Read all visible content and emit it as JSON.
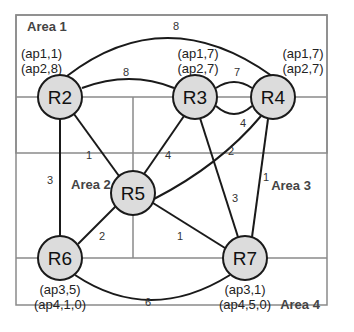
{
  "colors": {
    "frame": "#8a8a8a",
    "link": "#1a1a1a",
    "node_fill": "#dcdcdc",
    "node_stroke": "#1a1a1a",
    "background": "#ffffff"
  },
  "areas": [
    {
      "id": "area1",
      "label": "Area 1"
    },
    {
      "id": "area2",
      "label": "Area 2"
    },
    {
      "id": "area3",
      "label": "Area 3"
    },
    {
      "id": "area4",
      "label": "Area 4"
    }
  ],
  "nodes": [
    {
      "id": "R2",
      "label": "R2",
      "ap": [
        "(ap1,1)",
        "(ap2,8)"
      ]
    },
    {
      "id": "R3",
      "label": "R3",
      "ap": [
        "(ap1,7)",
        "(ap2,7)"
      ]
    },
    {
      "id": "R4",
      "label": "R4",
      "ap": [
        "(ap1,7)",
        "(ap2,7)"
      ]
    },
    {
      "id": "R5",
      "label": "R5",
      "ap": []
    },
    {
      "id": "R6",
      "label": "R6",
      "ap": [
        "(ap3,5)",
        "(ap4,1,0)"
      ]
    },
    {
      "id": "R7",
      "label": "R7",
      "ap": [
        "(ap3,1)",
        "(ap4,5,0)"
      ]
    }
  ],
  "links": [
    {
      "from": "R2",
      "to": "R4",
      "cost": "8",
      "shape": "arc-top"
    },
    {
      "from": "R2",
      "to": "R3",
      "cost": "8"
    },
    {
      "from": "R3",
      "to": "R4",
      "cost": "7",
      "shape": "upper"
    },
    {
      "from": "R3",
      "to": "R4",
      "cost": "4",
      "shape": "lower"
    },
    {
      "from": "R2",
      "to": "R5",
      "cost": "1"
    },
    {
      "from": "R2",
      "to": "R6",
      "cost": "3"
    },
    {
      "from": "R3",
      "to": "R5",
      "cost": "4"
    },
    {
      "from": "R4",
      "to": "R5",
      "cost": "2"
    },
    {
      "from": "R3",
      "to": "R7",
      "cost": "3"
    },
    {
      "from": "R4",
      "to": "R7",
      "cost": "1"
    },
    {
      "from": "R5",
      "to": "R6",
      "cost": "2"
    },
    {
      "from": "R5",
      "to": "R7",
      "cost": "1"
    },
    {
      "from": "R6",
      "to": "R7",
      "cost": "6",
      "shape": "arc-bottom"
    }
  ]
}
